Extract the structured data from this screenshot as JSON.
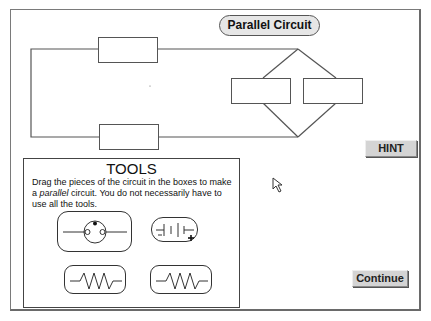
{
  "title": "Parallel Circuit",
  "buttons": {
    "hint": "HINT",
    "continue": "Continue"
  },
  "tools": {
    "heading": "TOOLS",
    "instructions_pre": "Drag the pieces of the circuit in the boxes to make a ",
    "instructions_em": "parallel",
    "instructions_post": " circuit.  You do not necessarily have to use all the tools.",
    "items": [
      {
        "name": "light-bulb",
        "icon": "bulb-icon"
      },
      {
        "name": "battery",
        "icon": "battery-icon"
      },
      {
        "name": "resistor-1",
        "icon": "resistor-icon"
      },
      {
        "name": "resistor-2",
        "icon": "resistor-icon"
      }
    ]
  },
  "drop_boxes": [
    "top-series",
    "bottom-series",
    "parallel-left",
    "parallel-right"
  ],
  "colors": {
    "wire": "#555555",
    "button_bg": "#d4d4d4",
    "pill_bg": "#e6e6e6"
  }
}
